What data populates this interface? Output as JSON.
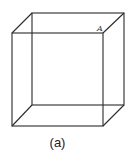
{
  "figure": {
    "caption": "(a)",
    "vertex_label": "A",
    "stroke_color": "#2a2a2a",
    "cube": {
      "front_face": {
        "top_left": [
          12,
          33
        ],
        "top_right": [
          103,
          33
        ],
        "bottom_right": [
          103,
          126
        ],
        "bottom_left": [
          12,
          126
        ]
      },
      "back_face": {
        "top_left": [
          32,
          13
        ],
        "top_right": [
          124,
          13
        ],
        "bottom_right": [
          124,
          105
        ],
        "bottom_left": [
          32,
          105
        ]
      }
    }
  }
}
